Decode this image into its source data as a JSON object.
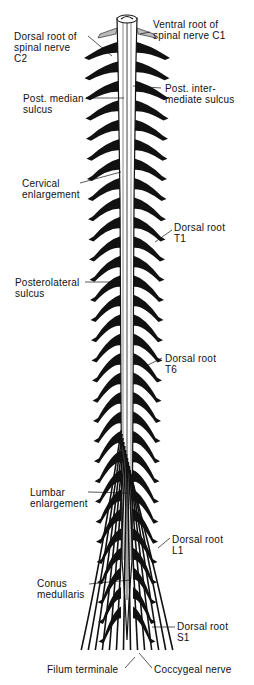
{
  "figure": {
    "colors": {
      "background": "#ffffff",
      "ink": "#111111"
    }
  },
  "labels": {
    "dorsal_root_c2": "Dorsal root of\nspinal nerve\nC2",
    "ventral_root_c1": "Ventral root of\nspinal nerve C1",
    "post_median_sulcus": "Post. median\nsulcus",
    "post_intermediate_sulcus": "Post. inter-\nmediate sulcus",
    "cervical_enlargement": "Cervical\nenlargement",
    "dorsal_root_t1": "Dorsal root\nT1",
    "posterolateral_sulcus": "Posterolateral\nsulcus",
    "dorsal_root_t6": "Dorsal root\nT6",
    "lumbar_enlargement": "Lumbar\nenlargement",
    "dorsal_root_l1": "Dorsal root\nL1",
    "conus_medullaris": "Conus\nmedullaris",
    "dorsal_root_s1": "Dorsal root\nS1",
    "filum_terminale": "Filum terminale",
    "coccygeal_nerve": "Coccygeal nerve"
  }
}
